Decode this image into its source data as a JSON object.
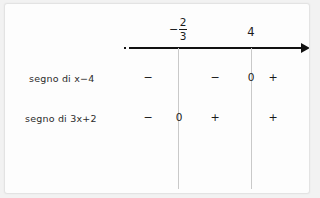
{
  "figure": {
    "type": "sign-chart",
    "language": "it",
    "axis": {
      "leading_ellipsis": "...",
      "arrow_direction": "right",
      "roots": [
        {
          "id": "root-a",
          "label": "-2/3",
          "display": {
            "minus": "−",
            "numerator": "2",
            "denominator": "3"
          }
        },
        {
          "id": "root-b",
          "label": "4",
          "display": {
            "text": "4"
          }
        }
      ]
    },
    "rows": [
      {
        "id": "row-x-minus-4",
        "label": "segno di x−4",
        "signs": [
          {
            "interval": "before--2/3",
            "value": "−"
          },
          {
            "interval": "between--2/3-and-4",
            "value": "−"
          },
          {
            "interval": "at-4",
            "value": "0"
          },
          {
            "interval": "after-4",
            "value": "+"
          }
        ]
      },
      {
        "id": "row-3x-plus-2",
        "label": "segno di 3x+2",
        "signs": [
          {
            "interval": "before--2/3",
            "value": "−"
          },
          {
            "interval": "at--2/3",
            "value": "0"
          },
          {
            "interval": "between--2/3-and-4",
            "value": "+"
          },
          {
            "interval": "after-4",
            "value": "+"
          }
        ]
      }
    ]
  },
  "chart_data": {
    "type": "table",
    "title": "",
    "categories": [
      "x < -2/3",
      "x = -2/3",
      "-2/3 < x < 4",
      "x = 4",
      "x > 4"
    ],
    "series": [
      {
        "name": "segno di x−4",
        "values": [
          "-",
          "-",
          "-",
          "0",
          "+"
        ]
      },
      {
        "name": "segno di 3x+2",
        "values": [
          "-",
          "0",
          "+",
          "+",
          "+"
        ]
      }
    ],
    "xlabel": "x",
    "ylabel": "",
    "annotations": [
      "-2/3",
      "4"
    ],
    "grid": false,
    "legend": "none"
  },
  "colors": {
    "axis": "#111111",
    "rule": "#c9c9c9",
    "text": "#1a1a1a",
    "paper": "#fdfdfd",
    "frame": "#f2f2f2"
  }
}
